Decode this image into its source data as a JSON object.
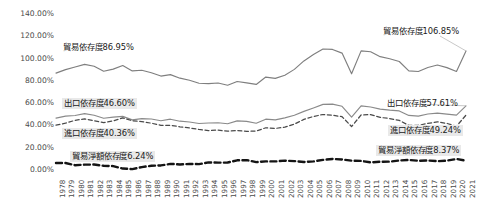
{
  "chart_data": {
    "type": "line",
    "title": "",
    "xlabel": "",
    "ylabel": "",
    "ylim": [
      0,
      140
    ],
    "grid": false,
    "legend_position": "none",
    "y_ticks": [
      "0.00%",
      "20.00%",
      "40.00%",
      "60.00%",
      "80.00%",
      "100.00%",
      "120.00%",
      "140.00%"
    ],
    "y_tick_values": [
      0,
      20,
      40,
      60,
      80,
      100,
      120,
      140
    ],
    "categories": [
      "1978",
      "1979",
      "1980",
      "1981",
      "1982",
      "1983",
      "1984",
      "1985",
      "1986",
      "1987",
      "1988",
      "1989",
      "1990",
      "1991",
      "1992",
      "1993",
      "1994",
      "1995",
      "1996",
      "1997",
      "1998",
      "1999",
      "2000",
      "2001",
      "2002",
      "2003",
      "2004",
      "2005",
      "2006",
      "2007",
      "2008",
      "2009",
      "2010",
      "2011",
      "2012",
      "2013",
      "2014",
      "2015",
      "2016",
      "2017",
      "2018",
      "2019",
      "2020",
      "2021"
    ],
    "series": [
      {
        "name": "貿易依存度",
        "style": "solid",
        "color": "#7f7f7f",
        "values": [
          86.95,
          90.1,
          92.4,
          94.8,
          93.1,
          88.6,
          90.5,
          93.8,
          88.9,
          89.5,
          87.3,
          84.3,
          85.6,
          82.4,
          80.6,
          77.9,
          77.5,
          78.1,
          76.1,
          79.4,
          78.2,
          76.8,
          83.4,
          82.2,
          85.1,
          90.3,
          97.9,
          103.6,
          108.6,
          108.2,
          104.9,
          86.3,
          106.9,
          106.1,
          101.7,
          99.8,
          97.4,
          88.9,
          88.4,
          92.0,
          94.2,
          91.9,
          88.4,
          106.85
        ]
      },
      {
        "name": "出口依存度",
        "style": "solid",
        "color": "#8a8a8a",
        "values": [
          46.6,
          48.3,
          48.9,
          50.6,
          49.1,
          46.4,
          47.5,
          48.1,
          45.0,
          46.1,
          45.8,
          44.2,
          45.6,
          43.8,
          43.1,
          41.7,
          42.2,
          42.4,
          41.5,
          44.1,
          43.6,
          42.0,
          45.6,
          45.0,
          46.8,
          49.2,
          52.6,
          55.7,
          58.9,
          59.1,
          57.2,
          47.4,
          57.6,
          56.5,
          54.6,
          53.7,
          53.0,
          49.0,
          48.4,
          50.3,
          51.1,
          50.2,
          49.2,
          57.61
        ]
      },
      {
        "name": "進口依存度",
        "style": "dashed",
        "color": "#4a4a4a",
        "values": [
          40.36,
          42.0,
          44.6,
          45.8,
          44.2,
          42.6,
          44.0,
          46.8,
          44.2,
          43.5,
          42.0,
          40.1,
          40.1,
          38.8,
          37.7,
          36.4,
          35.4,
          35.8,
          34.8,
          35.4,
          34.7,
          34.9,
          37.9,
          37.3,
          38.4,
          41.2,
          45.4,
          48.0,
          49.8,
          49.2,
          47.8,
          39.0,
          49.4,
          49.7,
          47.2,
          46.2,
          44.5,
          40.0,
          40.1,
          41.8,
          43.2,
          41.8,
          39.3,
          49.24
        ]
      },
      {
        "name": "貿易淨額依存度",
        "style": "bold-dashed",
        "color": "#141414",
        "values": [
          6.24,
          6.3,
          4.3,
          4.8,
          4.9,
          3.8,
          3.5,
          1.3,
          0.8,
          2.6,
          3.8,
          4.1,
          5.5,
          5.0,
          5.4,
          5.3,
          6.8,
          6.6,
          6.7,
          8.7,
          8.9,
          7.1,
          7.7,
          7.7,
          8.4,
          8.0,
          7.2,
          7.7,
          9.1,
          9.9,
          9.4,
          8.4,
          8.2,
          6.8,
          7.4,
          7.5,
          8.5,
          9.0,
          8.3,
          8.5,
          7.9,
          8.4,
          9.9,
          8.37
        ]
      }
    ],
    "annotations": [
      {
        "name": "trade-dependence-start",
        "text": "貿易依存度86.95%",
        "x": 61,
        "y": 42,
        "boxed": false
      },
      {
        "name": "trade-dependence-end",
        "text": "貿易依存度106.85%",
        "x": 381,
        "y": 26,
        "boxed": false
      },
      {
        "name": "export-dependence-start",
        "text": "出口依存度46.60%",
        "x": 62,
        "y": 98,
        "boxed": true
      },
      {
        "name": "export-dependence-end",
        "text": "出口依存度57.61%",
        "x": 385,
        "y": 98,
        "boxed": false
      },
      {
        "name": "import-dependence-start",
        "text": "進口依存度40.36%",
        "x": 62,
        "y": 128,
        "boxed": true
      },
      {
        "name": "import-dependence-end",
        "text": "進口依存度49.24%",
        "x": 388,
        "y": 125,
        "boxed": true
      },
      {
        "name": "net-trade-dependence-start",
        "text": "貿易淨額依存度6.24%",
        "x": 70,
        "y": 151,
        "boxed": true
      },
      {
        "name": "net-trade-dependence-end",
        "text": "貿易淨額依存度8.37%",
        "x": 376,
        "y": 145,
        "boxed": true
      }
    ]
  }
}
